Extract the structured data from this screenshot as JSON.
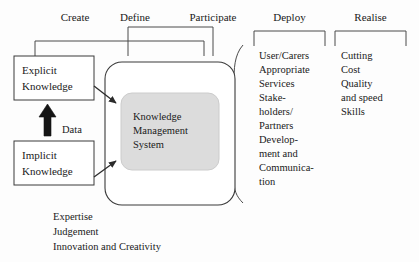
{
  "diagram": {
    "background_color": "#fdfdfd",
    "line_color": "#3a3a3a",
    "inner_fill_color": "#dcdcdc",
    "text_color": "#1a1a1a"
  },
  "phases": [
    {
      "id": "create",
      "label": "Create"
    },
    {
      "id": "define",
      "label": "Define"
    },
    {
      "id": "participate",
      "label": "Participate"
    },
    {
      "id": "deploy",
      "label": "Deploy"
    },
    {
      "id": "realise",
      "label": "Realise"
    }
  ],
  "input_boxes": [
    {
      "id": "explicit",
      "line1": "Explicit",
      "line2": "Knowledge"
    },
    {
      "id": "implicit",
      "line1": "Implicit",
      "line2": "Knowledge"
    }
  ],
  "flow": {
    "data_label": "Data"
  },
  "core": {
    "line1": "Knowledge",
    "line2": "Management",
    "line3": "System"
  },
  "deploy_column": {
    "heading": "Deploy",
    "lines": [
      "User/Carers",
      "Appropriate",
      "Services",
      "Stake-",
      "holders/",
      "Partners",
      "Develop-",
      "ment and",
      "Communica-",
      "tion"
    ]
  },
  "realise_column": {
    "heading": "Realise",
    "lines": [
      "Cutting",
      "Cost",
      "Quality",
      "and speed",
      "Skills"
    ]
  },
  "footer": {
    "lines": [
      "Expertise",
      "Judgement",
      "Innovation and Creativity"
    ]
  }
}
